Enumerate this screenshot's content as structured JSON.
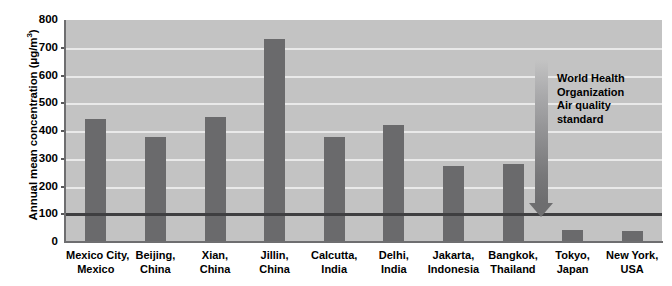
{
  "chart_data": {
    "type": "bar",
    "title": "",
    "xlabel": "",
    "ylabel": "Annual mean concentration (μg/m³)",
    "ylabel_parts": {
      "main": "Annual mean concentration (",
      "unit_mu": "μg/m",
      "unit_exp": "3",
      "closing": ")"
    },
    "ylim": [
      0,
      800
    ],
    "ytick_values": [
      0,
      100,
      200,
      300,
      400,
      500,
      600,
      700,
      800
    ],
    "ytick_labels": [
      "0",
      "100",
      "200",
      "300",
      "400",
      "500",
      "600",
      "700",
      "800"
    ],
    "grid": true,
    "gridlines_at": [
      100,
      200,
      300,
      400,
      500,
      600,
      700
    ],
    "legend": "none",
    "categories": [
      {
        "line1": "Mexico City,",
        "line2": "Mexico"
      },
      {
        "line1": "Beijing,",
        "line2": "China"
      },
      {
        "line1": "Xian,",
        "line2": "China"
      },
      {
        "line1": "Jillin,",
        "line2": "China"
      },
      {
        "line1": "Calcutta,",
        "line2": "India"
      },
      {
        "line1": "Delhi,",
        "line2": "India"
      },
      {
        "line1": "Jakarta,",
        "line2": "Indonesia"
      },
      {
        "line1": "Bangkok,",
        "line2": "Thailand"
      },
      {
        "line1": "Tokyo,",
        "line2": "Japan"
      },
      {
        "line1": "New York,",
        "line2": "USA"
      }
    ],
    "values": [
      443,
      380,
      450,
      732,
      380,
      420,
      275,
      280,
      45,
      40
    ],
    "annotations": [
      {
        "name": "who-standard",
        "text_lines": [
          "World Health",
          "Organization",
          "Air quality",
          "standard"
        ],
        "threshold_value": 100,
        "arrow": "down-arrow"
      }
    ],
    "colors": {
      "bar": "#6a6a6c",
      "plot_background": "#c3c3c3",
      "gridline": "#e9e9e9",
      "axis": "#6e6e70",
      "threshold_line": "#3f3f41",
      "text": "#000000",
      "page_background": "#ffffff"
    }
  }
}
